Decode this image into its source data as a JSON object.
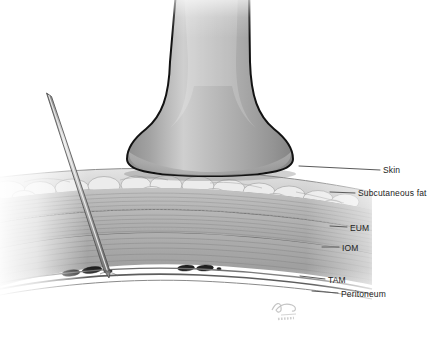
{
  "illustration": {
    "title": "Ultrasound-guided transversus abdominis plane block cross-section",
    "subject": "abdominal wall layers with ultrasound transducer and needle",
    "background_color": "#ffffff"
  },
  "labels": [
    {
      "id": "skin",
      "text": "Skin",
      "x": 383,
      "y": 170
    },
    {
      "id": "fat",
      "text": "Subcutaneous fat",
      "x": 358,
      "y": 193
    },
    {
      "id": "eum",
      "text": "EUM",
      "x": 350,
      "y": 228
    },
    {
      "id": "iom",
      "text": "IOM",
      "x": 342,
      "y": 248
    },
    {
      "id": "tam",
      "text": "TAM",
      "x": 328,
      "y": 280
    },
    {
      "id": "peritoneum",
      "text": "Peritoneum",
      "x": 341,
      "y": 294
    }
  ],
  "anatomy": {
    "layers": [
      {
        "name": "skin",
        "label": "Skin",
        "fill": "#c9c9c9"
      },
      {
        "name": "subcutaneous-fat",
        "label": "Subcutaneous fat",
        "fill": "#d8d8d8"
      },
      {
        "name": "external-oblique-muscle",
        "label": "EUM",
        "fill": "#b4b4b4"
      },
      {
        "name": "internal-oblique-muscle",
        "label": "IOM",
        "fill": "#aaaaaa"
      },
      {
        "name": "transversus-abdominis-muscle",
        "label": "TAM",
        "fill": "#a0a0a0"
      },
      {
        "name": "peritoneum",
        "label": "Peritoneum",
        "fill": "#9a9a9a"
      }
    ],
    "neurovascular_bundles": 4
  },
  "instruments": {
    "transducer": {
      "name": "ultrasound-probe",
      "fill": "#a9a9a9",
      "outline": "#1a1a1a"
    },
    "needle": {
      "name": "block-needle",
      "fill": "#cfcfcf",
      "outline": "#4a4a4a"
    }
  },
  "colors": {
    "label_text": "#232323",
    "leader_line": "#5a5a5a",
    "outline": "#1a1a1a"
  },
  "signature": {
    "text": "artist-signature-watermark"
  }
}
